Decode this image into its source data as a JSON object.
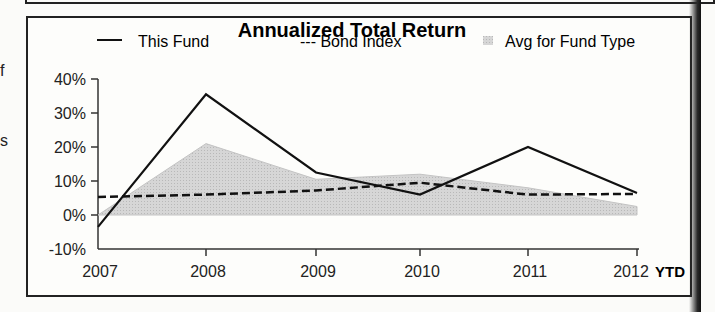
{
  "left_fragments": [
    "f",
    "s"
  ],
  "chart_data": {
    "type": "line",
    "title": "Annualized Total Return",
    "xlabel": "",
    "ylabel": "",
    "categories": [
      "2007",
      "2008",
      "2009",
      "2010",
      "2011",
      "2012"
    ],
    "x_suffix_label": "YTD",
    "yticks": [
      "40%",
      "30%",
      "20%",
      "10%",
      "0%",
      "-10%"
    ],
    "ylim": [
      -10,
      40
    ],
    "grid": false,
    "legend_position": "top",
    "series": [
      {
        "name": "This Fund",
        "legend_label": "This Fund",
        "style": "solid",
        "color": "#111111",
        "values": [
          -3.5,
          35.5,
          12.5,
          6,
          20,
          6.5
        ]
      },
      {
        "name": "Bond Index",
        "legend_label": "--- Bond Index",
        "style": "dashed",
        "color": "#111111",
        "values": [
          5.3,
          6,
          7.2,
          9.5,
          6,
          6.2
        ]
      },
      {
        "name": "Avg for Fund Type",
        "legend_label": "Avg for Fund Type",
        "style": "area",
        "color": "#cfcfcf",
        "values": [
          -1.5,
          21,
          10.5,
          12,
          8,
          2.5
        ]
      }
    ]
  }
}
